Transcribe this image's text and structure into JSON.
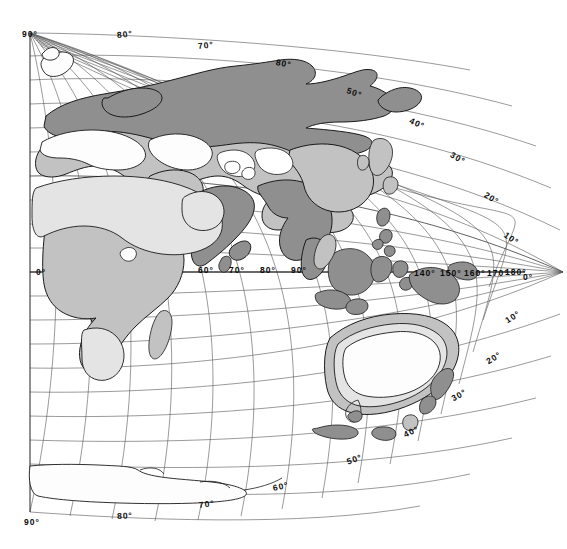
{
  "map": {
    "title": "World map, oblique azimuthal projection centered on the Eastern Hemisphere",
    "projection": "oblique-azimuthal",
    "background_color": "#ffffff",
    "graticule": {
      "line_color": "#555555",
      "interval_degrees": 10,
      "visible": true
    },
    "shading": {
      "levels": [
        {
          "name": "dark",
          "color": "#8f8f8f"
        },
        {
          "name": "medium",
          "color": "#c2c2c2"
        },
        {
          "name": "light",
          "color": "#e4e4e4"
        },
        {
          "name": "unshaded",
          "color": "#ffffff"
        }
      ],
      "outline_color": "#1a1a1a"
    },
    "degree_symbol": "°",
    "labels": [
      {
        "id": "lat-90-n",
        "text": "90°",
        "x": 22,
        "y": 29,
        "rotate": 0,
        "kind": "latitude"
      },
      {
        "id": "lat-80-n-top",
        "text": "80°",
        "x": 117,
        "y": 30,
        "rotate": -6,
        "kind": "latitude"
      },
      {
        "id": "lat-70-n-top",
        "text": "70°",
        "x": 198,
        "y": 41,
        "rotate": -6,
        "kind": "latitude"
      },
      {
        "id": "lat-80-n-right",
        "text": "80°",
        "x": 276,
        "y": 57,
        "rotate": 10,
        "kind": "latitude"
      },
      {
        "id": "lat-50-n",
        "text": "50°",
        "x": 347,
        "y": 85,
        "rotate": 20,
        "kind": "latitude"
      },
      {
        "id": "lat-40-n",
        "text": "40°",
        "x": 410,
        "y": 115,
        "rotate": 25,
        "kind": "latitude"
      },
      {
        "id": "lat-30-n",
        "text": "30°",
        "x": 451,
        "y": 149,
        "rotate": 30,
        "kind": "latitude"
      },
      {
        "id": "lat-20-n",
        "text": "20°",
        "x": 485,
        "y": 189,
        "rotate": 32,
        "kind": "latitude"
      },
      {
        "id": "lat-10-n",
        "text": "10°",
        "x": 505,
        "y": 229,
        "rotate": 34,
        "kind": "latitude"
      },
      {
        "id": "lat-0-left",
        "text": "0°",
        "x": 36,
        "y": 267,
        "rotate": 0,
        "kind": "latitude"
      },
      {
        "id": "lat-0-right",
        "text": "0°",
        "x": 523,
        "y": 272,
        "rotate": 0,
        "kind": "latitude"
      },
      {
        "id": "lat-10-s",
        "text": "10°",
        "x": 506,
        "y": 316,
        "rotate": -32,
        "kind": "latitude"
      },
      {
        "id": "lat-20-s",
        "text": "20°",
        "x": 487,
        "y": 357,
        "rotate": -32,
        "kind": "latitude"
      },
      {
        "id": "lat-30-s",
        "text": "30°",
        "x": 452,
        "y": 394,
        "rotate": -30,
        "kind": "latitude"
      },
      {
        "id": "lat-40-s",
        "text": "40°",
        "x": 404,
        "y": 430,
        "rotate": -25,
        "kind": "latitude"
      },
      {
        "id": "lat-50-s",
        "text": "50°",
        "x": 347,
        "y": 457,
        "rotate": -20,
        "kind": "latitude"
      },
      {
        "id": "lat-60-s",
        "text": "60°",
        "x": 273,
        "y": 483,
        "rotate": -12,
        "kind": "latitude"
      },
      {
        "id": "lat-70-s",
        "text": "70°",
        "x": 199,
        "y": 500,
        "rotate": -7,
        "kind": "latitude"
      },
      {
        "id": "lat-80-s",
        "text": "80°",
        "x": 117,
        "y": 511,
        "rotate": -3,
        "kind": "latitude"
      },
      {
        "id": "lat-90-s",
        "text": "90°",
        "x": 24,
        "y": 517,
        "rotate": 0,
        "kind": "latitude"
      },
      {
        "id": "lon-60",
        "text": "60°",
        "x": 198,
        "y": 265,
        "rotate": 0,
        "kind": "longitude"
      },
      {
        "id": "lon-70",
        "text": "70°",
        "x": 229,
        "y": 265,
        "rotate": 0,
        "kind": "longitude"
      },
      {
        "id": "lon-80",
        "text": "80°",
        "x": 260,
        "y": 265,
        "rotate": 0,
        "kind": "longitude"
      },
      {
        "id": "lon-90",
        "text": "90°",
        "x": 291,
        "y": 265,
        "rotate": 0,
        "kind": "longitude"
      },
      {
        "id": "lon-140",
        "text": "140°",
        "x": 414,
        "y": 268,
        "rotate": 0,
        "kind": "longitude"
      },
      {
        "id": "lon-150",
        "text": "150°",
        "x": 440,
        "y": 268,
        "rotate": 0,
        "kind": "longitude"
      },
      {
        "id": "lon-160",
        "text": "160°",
        "x": 464,
        "y": 268,
        "rotate": 0,
        "kind": "longitude"
      },
      {
        "id": "lon-170",
        "text": "170°",
        "x": 487,
        "y": 268,
        "rotate": 0,
        "kind": "longitude"
      },
      {
        "id": "lon-180",
        "text": "180°",
        "x": 505,
        "y": 267,
        "rotate": 0,
        "kind": "longitude"
      }
    ]
  }
}
